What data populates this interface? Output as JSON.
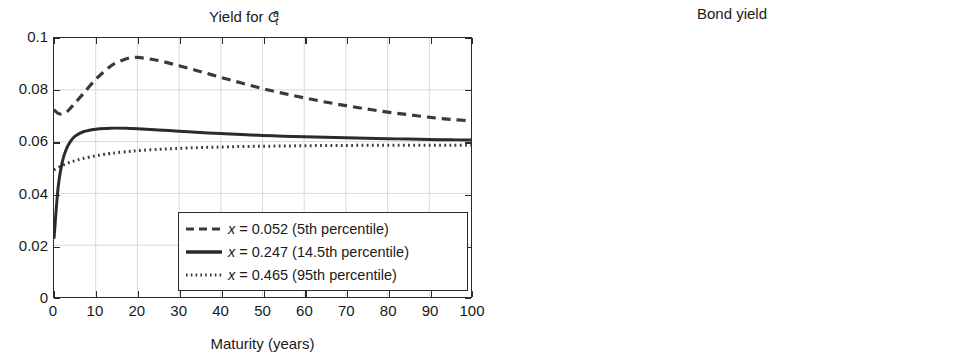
{
  "figure": {
    "background": "#ffffff",
    "axis_color": "#2b2b2b",
    "grid_color": "#d9d9d9",
    "curve_color": "#3a3a3a"
  },
  "panels": [
    {
      "id": "yield-ca",
      "title_prefix": "Yield for ",
      "title_var": "C",
      "title_sub": "t",
      "title_sup": "a",
      "title_plain": "Yield for C_t^a",
      "xlabel": "Maturity (years)",
      "yticks": [
        "0",
        "0.02",
        "0.04",
        "0.06",
        "0.08",
        "0.1"
      ],
      "xticks": [
        "0",
        "10",
        "20",
        "30",
        "40",
        "50",
        "60",
        "70",
        "80",
        "90",
        "100"
      ],
      "has_legend": true
    },
    {
      "id": "bond-yield",
      "title_plain": "Bond yield",
      "xlabel": "Maturity (years)",
      "yticks": [
        "0",
        "0.02",
        "0.04",
        "0.06",
        "0.08",
        "0.1"
      ],
      "xticks": [
        "0",
        "10",
        "20",
        "30",
        "40",
        "50",
        "60",
        "70",
        "80",
        "90",
        "100"
      ],
      "has_legend": false
    }
  ],
  "legend": {
    "entries": [
      {
        "style": "dashed",
        "var": "x",
        "eq": " = 0.052 (5th percentile)",
        "text": "x = 0.052 (5th percentile)"
      },
      {
        "style": "solid",
        "var": "x",
        "eq": " = 0.247 (14.5th percentile)",
        "text": "x = 0.247 (14.5th percentile)"
      },
      {
        "style": "dotted",
        "var": "x",
        "eq": " = 0.465 (95th percentile)",
        "text": "x = 0.465 (95th percentile)"
      }
    ]
  },
  "chart_data": [
    {
      "type": "line",
      "title": "Yield for C_t^a",
      "xlabel": "Maturity (years)",
      "ylabel": "",
      "xlim": [
        0,
        100
      ],
      "ylim": [
        0,
        0.1
      ],
      "xticks": [
        0,
        10,
        20,
        30,
        40,
        50,
        60,
        70,
        80,
        90,
        100
      ],
      "yticks": [
        0,
        0.02,
        0.04,
        0.06,
        0.08,
        0.1
      ],
      "grid": true,
      "legend_position": "lower right",
      "x": [
        0,
        1,
        2,
        3,
        4,
        5,
        7,
        10,
        13,
        15,
        18,
        20,
        25,
        30,
        35,
        40,
        45,
        50,
        55,
        60,
        65,
        70,
        75,
        80,
        85,
        90,
        95,
        100
      ],
      "series": [
        {
          "name": "x = 0.052 (5th percentile)",
          "style": "dashed",
          "values": [
            0.0723,
            0.0709,
            0.0706,
            0.0714,
            0.073,
            0.0748,
            0.0785,
            0.084,
            0.0884,
            0.0905,
            0.0923,
            0.0925,
            0.0913,
            0.0893,
            0.0871,
            0.0848,
            0.0826,
            0.0805,
            0.0786,
            0.0769,
            0.0753,
            0.0739,
            0.0726,
            0.0714,
            0.0704,
            0.0694,
            0.0686,
            0.068
          ]
        },
        {
          "name": "x = 0.247 (14.5th percentile)",
          "style": "solid",
          "values": [
            0.0225,
            0.0425,
            0.0522,
            0.0573,
            0.0602,
            0.062,
            0.0638,
            0.0648,
            0.0651,
            0.0652,
            0.0651,
            0.065,
            0.0645,
            0.064,
            0.0635,
            0.0631,
            0.0627,
            0.0624,
            0.0621,
            0.0619,
            0.0617,
            0.0615,
            0.0613,
            0.0611,
            0.061,
            0.0608,
            0.0607,
            0.0606
          ]
        },
        {
          "name": "x = 0.465 (95th percentile)",
          "style": "dotted",
          "values": [
            0.0491,
            0.05,
            0.0508,
            0.0515,
            0.0521,
            0.0526,
            0.0535,
            0.0545,
            0.0553,
            0.0557,
            0.0562,
            0.0565,
            0.057,
            0.0574,
            0.0577,
            0.0579,
            0.0581,
            0.0582,
            0.0583,
            0.0584,
            0.0585,
            0.0585,
            0.0586,
            0.0586,
            0.0586,
            0.0586,
            0.0586,
            0.0586
          ]
        }
      ]
    },
    {
      "type": "line",
      "title": "Bond yield",
      "xlabel": "Maturity (years)",
      "ylabel": "",
      "xlim": [
        0,
        100
      ],
      "ylim": [
        0,
        0.1
      ],
      "xticks": [
        0,
        10,
        20,
        30,
        40,
        50,
        60,
        70,
        80,
        90,
        100
      ],
      "yticks": [
        0,
        0.02,
        0.04,
        0.06,
        0.08,
        0.1
      ],
      "grid": true,
      "legend_position": "none",
      "x": [
        0,
        10,
        20,
        30,
        40,
        50,
        60,
        70,
        80,
        90,
        100
      ],
      "series": [
        {
          "name": "x = 0.052 (5th percentile)",
          "style": "dashed",
          "values": [
            0.0492,
            0.0491,
            0.049,
            0.0489,
            0.0488,
            0.0487,
            0.0486,
            0.0485,
            0.0484,
            0.0484,
            0.0483
          ]
        },
        {
          "name": "x = 0.247 (14.5th percentile)",
          "style": "solid",
          "values": [
            0.0489,
            0.0488,
            0.0487,
            0.0487,
            0.0486,
            0.0485,
            0.0484,
            0.0484,
            0.0483,
            0.0482,
            0.0482
          ]
        },
        {
          "name": "x = 0.465 (95th percentile)",
          "style": "dotted",
          "values": [
            0.0486,
            0.0486,
            0.0485,
            0.0485,
            0.0484,
            0.0483,
            0.0483,
            0.0482,
            0.0482,
            0.0481,
            0.0481
          ]
        }
      ]
    }
  ]
}
